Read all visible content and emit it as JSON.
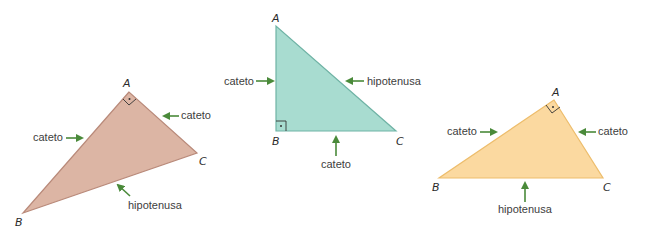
{
  "colors": {
    "arrow": "#4a8a3a",
    "triangle1_fill": "#dcb5a4",
    "triangle1_stroke": "#b98a7a",
    "triangle2_fill": "#a8dcd0",
    "triangle2_stroke": "#6fb3a5",
    "triangle3_fill": "#fbd9a0",
    "triangle3_stroke": "#edbd6c"
  },
  "triangles": [
    {
      "vertices": {
        "A": "A",
        "B": "B",
        "C": "C"
      },
      "labels": {
        "leg1": "cateto",
        "leg2": "cateto",
        "hypotenuse": "hipotenusa"
      }
    },
    {
      "vertices": {
        "A": "A",
        "B": "B",
        "C": "C"
      },
      "labels": {
        "leg1": "cateto",
        "leg2": "cateto",
        "hypotenuse": "hipotenusa"
      }
    },
    {
      "vertices": {
        "A": "A",
        "B": "B",
        "C": "C"
      },
      "labels": {
        "leg1": "cateto",
        "leg2": "cateto",
        "hypotenuse": "hipotenusa"
      }
    }
  ]
}
